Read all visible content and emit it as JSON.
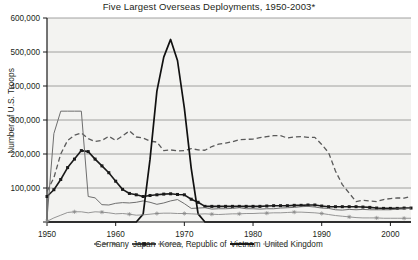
{
  "chart_data": {
    "type": "line",
    "title": "Five Largest Overseas Deployments, 1950-2003*",
    "xlabel": "",
    "ylabel": "Number of U.S. Troops",
    "xlim": [
      1950,
      2003
    ],
    "ylim": [
      0,
      600000
    ],
    "grid": true,
    "legend_position": "bottom",
    "xticks": [
      1950,
      1960,
      1970,
      1980,
      1990,
      2000
    ],
    "xtick_labels": [
      "1950",
      "1960",
      "1970",
      "1980",
      "1990",
      "2000"
    ],
    "yticks": [
      0,
      100000,
      200000,
      300000,
      400000,
      500000,
      600000
    ],
    "ytick_labels": [
      "",
      "100,000",
      "200,000",
      "300,000",
      "400,000",
      "500,000",
      "600,000"
    ],
    "x": [
      1950,
      1951,
      1952,
      1953,
      1954,
      1955,
      1956,
      1957,
      1958,
      1959,
      1960,
      1961,
      1962,
      1963,
      1964,
      1965,
      1966,
      1967,
      1968,
      1969,
      1970,
      1971,
      1972,
      1973,
      1974,
      1975,
      1976,
      1977,
      1978,
      1979,
      1980,
      1981,
      1982,
      1983,
      1984,
      1985,
      1986,
      1987,
      1988,
      1989,
      1990,
      1991,
      1992,
      1993,
      1994,
      1995,
      1996,
      1997,
      1998,
      1999,
      2000,
      2001,
      2002,
      2003
    ],
    "series": [
      {
        "name": "Germany",
        "style": "dashed",
        "color": "#5a5a5a",
        "values": [
          90000,
          130000,
          200000,
          240000,
          255000,
          262000,
          245000,
          237000,
          240000,
          252000,
          240000,
          253000,
          268000,
          250000,
          247000,
          238000,
          235000,
          210000,
          212000,
          209000,
          210000,
          216000,
          212000,
          211000,
          222000,
          229000,
          232000,
          236000,
          242000,
          243000,
          244000,
          248000,
          251000,
          254000,
          254000,
          247000,
          250000,
          251000,
          249000,
          249000,
          228000,
          204000,
          150000,
          110000,
          85000,
          60000,
          64000,
          62000,
          60000,
          66000,
          69000,
          71000,
          70000,
          75000
        ]
      },
      {
        "name": "Japan",
        "style": "solid-square",
        "color": "#1a1a1a",
        "values": [
          75000,
          95000,
          125000,
          160000,
          185000,
          210000,
          207000,
          185000,
          165000,
          145000,
          120000,
          96000,
          84000,
          80000,
          75000,
          78000,
          80000,
          82000,
          83000,
          81000,
          80000,
          67000,
          58000,
          46000,
          46000,
          46000,
          46000,
          46000,
          46000,
          46000,
          46000,
          46000,
          47000,
          48000,
          48000,
          48000,
          49000,
          49000,
          50000,
          50000,
          47000,
          45000,
          45000,
          45000,
          45000,
          45000,
          44000,
          43000,
          41000,
          40000,
          40000,
          40000,
          41000,
          41000
        ]
      },
      {
        "name": "Korea, Republic of",
        "style": "thin",
        "color": "#6e6e6e",
        "values": [
          10000,
          260000,
          326000,
          326000,
          326000,
          326000,
          75000,
          71000,
          51000,
          50000,
          55000,
          57000,
          56000,
          58000,
          62000,
          58000,
          52000,
          56000,
          62000,
          66000,
          54000,
          40000,
          41000,
          42000,
          38000,
          39000,
          39000,
          40000,
          42000,
          39000,
          39000,
          38000,
          39000,
          39000,
          41000,
          42000,
          43000,
          45000,
          46000,
          44000,
          41000,
          40000,
          36000,
          35000,
          37000,
          36000,
          37000,
          36000,
          36000,
          36000,
          36000,
          38000,
          38000,
          41000
        ]
      },
      {
        "name": "Vietnam",
        "style": "thick",
        "color": "#111111",
        "values": [
          0,
          0,
          0,
          0,
          0,
          0,
          0,
          0,
          0,
          0,
          0,
          0,
          0,
          0,
          23000,
          184000,
          385000,
          485000,
          537000,
          475000,
          335000,
          158000,
          24000,
          0,
          0,
          0,
          0,
          0,
          0,
          0,
          0,
          0,
          0,
          0,
          0,
          0,
          0,
          0,
          0,
          0,
          0,
          0,
          0,
          0,
          0,
          0,
          0,
          0,
          0,
          0,
          0,
          0,
          0,
          0
        ]
      },
      {
        "name": "United Kingdom",
        "style": "thin-star",
        "color": "#8a8a8a",
        "values": [
          2000,
          12000,
          20000,
          28000,
          30000,
          30000,
          27000,
          30000,
          29000,
          27000,
          24000,
          25000,
          23000,
          20000,
          21000,
          23000,
          25000,
          26000,
          26000,
          25000,
          25000,
          24000,
          23000,
          24000,
          23000,
          22000,
          23000,
          24000,
          24000,
          25000,
          25000,
          26000,
          26000,
          27000,
          27000,
          28000,
          29000,
          29000,
          28000,
          27000,
          25000,
          22000,
          19000,
          17000,
          15000,
          13000,
          12000,
          12000,
          12000,
          11000,
          11000,
          11000,
          11000,
          11000
        ]
      }
    ]
  },
  "legend": {
    "items": [
      {
        "label": "Germany",
        "marker": "dashed-line-swatch"
      },
      {
        "label": "Japan",
        "marker": "square-marker-line-swatch"
      },
      {
        "label": "Korea, Republic of",
        "marker": "thin-line-swatch"
      },
      {
        "label": "Vietnam",
        "marker": "thick-line-swatch"
      },
      {
        "label": "United Kingdom",
        "marker": "star-marker-line-swatch"
      }
    ]
  }
}
